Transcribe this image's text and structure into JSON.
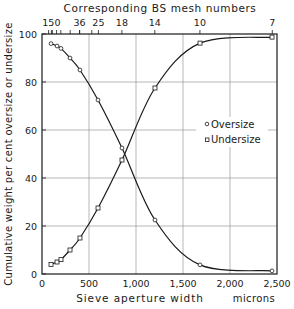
{
  "chart_data": {
    "type": "line",
    "title": "",
    "xlabel": "Sieve aperture width",
    "xunit": "microns",
    "ylabel": "Cumulative weight per cent oversize or undersize",
    "x2label": "Corresponding BS mesh numbers",
    "xlim": [
      0,
      2500
    ],
    "ylim": [
      0,
      100
    ],
    "xticks": [
      0,
      500,
      1000,
      1500,
      2000,
      2500
    ],
    "xtick_labels": [
      "0",
      "500",
      "1,000",
      "1,500",
      "2,000",
      "2,500"
    ],
    "yticks": [
      0,
      20,
      40,
      60,
      80,
      100
    ],
    "ytick_labels": [
      "0",
      "20",
      "40",
      "60",
      "80",
      "100"
    ],
    "x2_ticks": [
      {
        "label": "150",
        "x": 100
      },
      {
        "label": "36",
        "x": 400
      },
      {
        "label": "25",
        "x": 600
      },
      {
        "label": "18",
        "x": 850
      },
      {
        "label": "14",
        "x": 1200
      },
      {
        "label": "10",
        "x": 1680
      },
      {
        "label": "7",
        "x": 2450
      }
    ],
    "x2_minor_ticks": [
      70,
      110,
      155,
      200,
      300,
      400,
      530
    ],
    "grid": true,
    "legend_position": "right-center",
    "series": [
      {
        "name": "Oversize",
        "marker": "circle",
        "x": [
          96,
          160,
          202,
          298,
          404,
          596,
          851,
          1202,
          1681,
          2447
        ],
        "y": [
          96,
          95,
          94,
          90,
          85,
          72.5,
          52.5,
          22.5,
          3.8,
          1.3
        ]
      },
      {
        "name": "Undersize",
        "marker": "square",
        "x": [
          96,
          160,
          202,
          298,
          404,
          596,
          851,
          1202,
          1681,
          2447
        ],
        "y": [
          4,
          5,
          6,
          10,
          15,
          27.5,
          47.5,
          77.5,
          96.2,
          98.7
        ]
      }
    ]
  },
  "legend": {
    "oversize_label": "Oversize",
    "undersize_label": "Undersize"
  },
  "axis": {
    "x_title": "Sieve aperture width",
    "x_unit": "microns",
    "y_title": "Cumulative weight per cent oversize or undersize",
    "top_title": "Corresponding BS mesh numbers"
  }
}
